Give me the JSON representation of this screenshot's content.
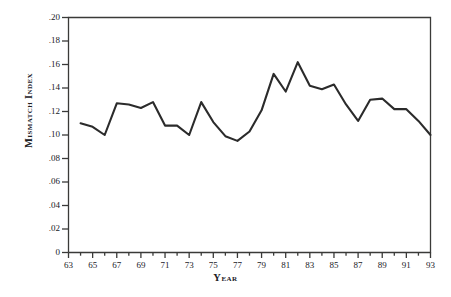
{
  "chart_data": {
    "type": "line",
    "title": "",
    "xlabel": "Year",
    "ylabel": "Mismatch Index",
    "xlim": [
      63,
      93
    ],
    "ylim": [
      0,
      0.2
    ],
    "grid": false,
    "legend": null,
    "y_ticks": [
      "0",
      ".02",
      ".04",
      ".06",
      ".08",
      ".10",
      ".12",
      ".14",
      ".16",
      ".18",
      ".20"
    ],
    "y_tick_values": [
      0,
      0.02,
      0.04,
      0.06,
      0.08,
      0.1,
      0.12,
      0.14,
      0.16,
      0.18,
      0.2
    ],
    "x_ticks": [
      "63",
      "65",
      "67",
      "69",
      "71",
      "73",
      "75",
      "77",
      "79",
      "81",
      "83",
      "85",
      "87",
      "89",
      "91",
      "93"
    ],
    "x_tick_values": [
      63,
      65,
      67,
      69,
      71,
      73,
      75,
      77,
      79,
      81,
      83,
      85,
      87,
      89,
      91,
      93
    ],
    "x_minor_tick_values": [
      64,
      66,
      68,
      70,
      72,
      74,
      76,
      78,
      80,
      82,
      84,
      86,
      88,
      90,
      92
    ],
    "series": [
      {
        "name": "Mismatch Index",
        "color": "#2b2b2b",
        "x": [
          64,
          65,
          66,
          67,
          68,
          69,
          70,
          71,
          72,
          73,
          74,
          75,
          76,
          77,
          78,
          79,
          80,
          81,
          82,
          83,
          84,
          85,
          86,
          87,
          88,
          89,
          90,
          91,
          92,
          93
        ],
        "values": [
          0.11,
          0.107,
          0.1,
          0.127,
          0.126,
          0.123,
          0.128,
          0.108,
          0.108,
          0.1,
          0.128,
          0.111,
          0.099,
          0.095,
          0.103,
          0.121,
          0.152,
          0.137,
          0.162,
          0.142,
          0.139,
          0.143,
          0.126,
          0.112,
          0.13,
          0.131,
          0.122,
          0.122,
          0.112,
          0.1
        ]
      }
    ]
  },
  "axis_titles": {
    "y": "Mismatch Index",
    "x": "Year"
  }
}
